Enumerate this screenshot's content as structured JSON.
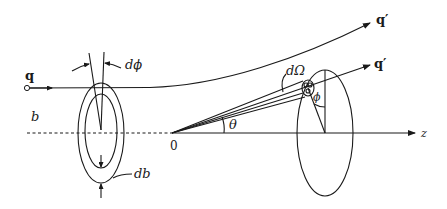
{
  "diagram": {
    "type": "scattering-geometry",
    "labels": {
      "incoming_momentum": "q",
      "scattered_momentum_upper": "q′",
      "scattered_momentum_lower": "q′",
      "impact_parameter": "b",
      "azimuth_increment": "dϕ",
      "impact_parameter_increment": "db",
      "solid_angle": "dΩ",
      "azimuth": "ϕ",
      "scattering_angle": "θ",
      "origin": "0",
      "axis": "z"
    },
    "colors": {
      "ink": "#1a1a1a",
      "background": "#ffffff"
    }
  }
}
